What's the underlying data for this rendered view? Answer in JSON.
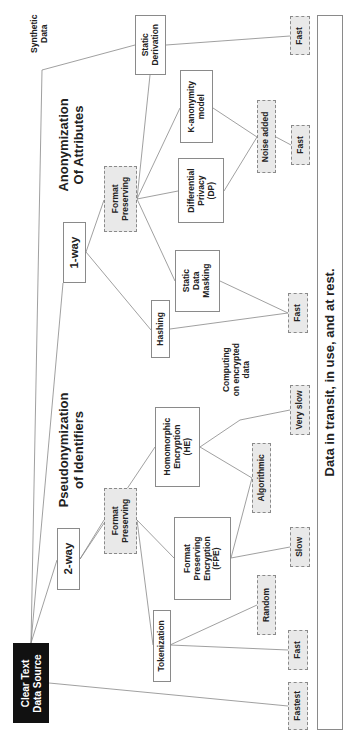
{
  "source": {
    "label_line1": "Clear Text",
    "label_line2": "Data Source"
  },
  "synthetic": {
    "label_line1": "Synthetic",
    "label_line2": "Data"
  },
  "titles": {
    "pseudonymization_line1": "Pseudonymization",
    "pseudonymization_line2": "of Identifiers",
    "anonymization_line1": "Anonymization",
    "anonymization_line2": "Of Attributes"
  },
  "branches": {
    "two_way": "2-way",
    "one_way": "1-way"
  },
  "nodes": {
    "fp_two_way": {
      "line1": "Format",
      "line2": "Preserving"
    },
    "fp_one_way": {
      "line1": "Format",
      "line2": "Preserving"
    },
    "tokenization": "Tokenization",
    "fpe": {
      "line1": "Format",
      "line2": "Preserving",
      "line3": "Encryption",
      "line4": "(FPE)"
    },
    "he": {
      "line1": "Homomorphic",
      "line2": "Encryption",
      "line3": "(HE)"
    },
    "hashing": "Hashing",
    "static_masking": {
      "line1": "Static",
      "line2": "Data",
      "line3": "Masking"
    },
    "dp": {
      "line1": "Differential",
      "line2": "Privacy",
      "line3": "(DP)"
    },
    "k_anon": {
      "line1": "K-anonymity",
      "line2": "model"
    },
    "static_derivation": {
      "line1": "Static",
      "line2": "Derivation"
    }
  },
  "attributes": {
    "fastest": "Fastest",
    "fast_token": "Fast",
    "random": "Random",
    "slow": "Slow",
    "algorithmic": "Algorithmic",
    "very_slow": "Very slow",
    "fast_mid": "Fast",
    "noise_added": "Noise added",
    "fast_noise": "Fast",
    "fast_derivation": "Fast"
  },
  "annotations": {
    "computing_line1": "Computing",
    "computing_line2": "on encrypted",
    "computing_line3": "data"
  },
  "footer_bar": "Data in transit, in use, and at rest.",
  "colors": {
    "dark_node": "#111111",
    "attribute_fill": "#e9e9e9",
    "border": "#8a8a8a"
  }
}
